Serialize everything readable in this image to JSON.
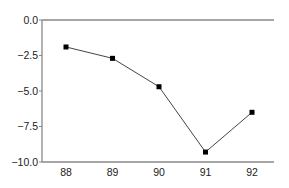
{
  "chart_data": {
    "type": "line",
    "title": "",
    "xlabel": "",
    "ylabel": "",
    "categories": [
      "88",
      "89",
      "90",
      "91",
      "92"
    ],
    "values": [
      -1.9,
      -2.7,
      -4.7,
      -9.3,
      -6.5
    ],
    "series": [
      {
        "name": "",
        "values": [
          -1.9,
          -2.7,
          -4.7,
          -9.3,
          -6.5
        ],
        "marker": "square",
        "color": "#000000"
      }
    ],
    "ylim": [
      -10.0,
      0.0
    ],
    "yticks": [
      "0.0",
      "-2.5",
      "-5.0",
      "-7.5",
      "-10.0"
    ],
    "ytick_values": [
      0.0,
      -2.5,
      -5.0,
      -7.5,
      -10.0
    ],
    "grid": false,
    "legend": null
  },
  "colors": {
    "axis": "#888888",
    "line": "#444444",
    "marker": "#000000"
  }
}
